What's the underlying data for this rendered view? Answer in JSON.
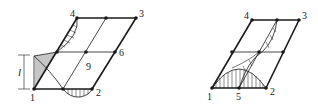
{
  "figure_left": {
    "title": "Mode shape along edge 1-4 (vertical hatching) and edge 1-2",
    "node_labels": {
      "n1": "1",
      "n2": "2",
      "n3": "3",
      "n4": "4",
      "n6": "6",
      "n9": "9"
    },
    "dimension_label": "l"
  },
  "figure_right": {
    "title": "Mode shape along edge 1-2 (parabolic) and diagonal",
    "node_labels": {
      "n1": "1",
      "n2": "2",
      "n3": "3",
      "n4": "4",
      "n5": "5"
    }
  },
  "colors": {
    "line": "#1a1a1a",
    "thin": "#333333"
  }
}
